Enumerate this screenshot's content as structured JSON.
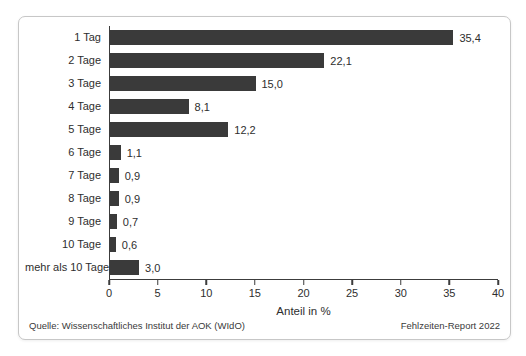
{
  "chart_data": {
    "type": "bar",
    "orientation": "horizontal",
    "title": "",
    "categories": [
      "1 Tag",
      "2 Tage",
      "3 Tage",
      "4 Tage",
      "5 Tage",
      "6 Tage",
      "7 Tage",
      "8 Tage",
      "9 Tage",
      "10 Tage",
      "mehr als 10 Tage"
    ],
    "values": [
      35.4,
      22.1,
      15.0,
      8.1,
      12.2,
      1.1,
      0.9,
      0.9,
      0.7,
      0.6,
      3.0
    ],
    "value_labels": [
      "35,4",
      "22,1",
      "15,0",
      "8,1",
      "12,2",
      "1,1",
      "0,9",
      "0,9",
      "0,7",
      "0,6",
      "3,0"
    ],
    "xlabel": "Anteil in %",
    "ylabel": "",
    "xlim": [
      0,
      40
    ],
    "xticks": [
      0,
      5,
      10,
      15,
      20,
      25,
      30,
      35,
      40
    ],
    "grid": "off",
    "legend": "none",
    "bar_color": "#3a3a3a"
  },
  "footer": {
    "source": "Quelle: Wissenschaftliches Institut der AOK (WIdO)",
    "report": "Fehlzeiten-Report 2022"
  }
}
